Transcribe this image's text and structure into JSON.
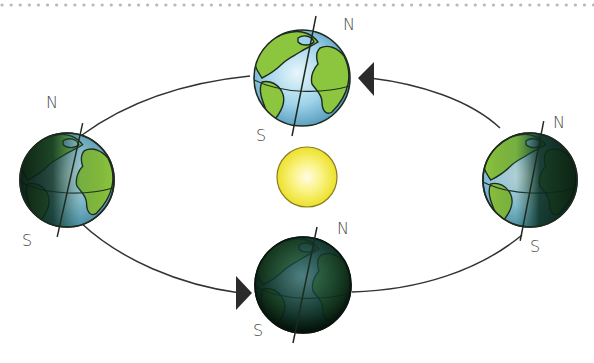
{
  "diagram": {
    "border": {
      "style": "dotted",
      "color": "#b9b9b9"
    },
    "sun": {
      "label": "",
      "color": "#f2e62c",
      "core_color": "#fffbe0"
    },
    "globes": [
      {
        "id": "top",
        "north_label": "N",
        "south_label": "S",
        "lighting": "lit"
      },
      {
        "id": "left",
        "north_label": "N",
        "south_label": "S",
        "lighting": "left-dark"
      },
      {
        "id": "right",
        "north_label": "N",
        "south_label": "S",
        "lighting": "right-dark"
      },
      {
        "id": "bottom",
        "north_label": "N",
        "south_label": "S",
        "lighting": "dark"
      }
    ],
    "orbit": {
      "direction": "counterclockwise",
      "arrows": [
        "top-right pointing left",
        "bottom-left pointing right"
      ]
    },
    "colors": {
      "ocean": "#9fd3ea",
      "land": "#8cc63f",
      "outline": "#1f2a1f",
      "night": "#0d2a1e",
      "orbit_line": "#333333",
      "arrow": "#2b2b2b"
    }
  }
}
